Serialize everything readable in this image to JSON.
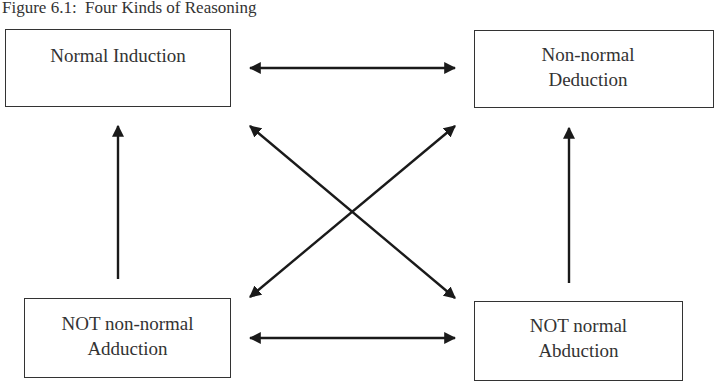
{
  "figure": {
    "title": "Figure 6.1:  Four Kinds of Reasoning"
  },
  "nodes": {
    "top_left": {
      "line1": "Normal Induction",
      "line2": ""
    },
    "top_right": {
      "line1": "Non-normal",
      "line2": "Deduction"
    },
    "bottom_left": {
      "line1": "NOT non-normal",
      "line2": "Adduction"
    },
    "bottom_right": {
      "line1": "NOT normal",
      "line2": "Abduction"
    }
  },
  "edges": [
    {
      "from": "top_left",
      "to": "top_right",
      "type": "bidirectional"
    },
    {
      "from": "bottom_left",
      "to": "bottom_right",
      "type": "bidirectional"
    },
    {
      "from": "top_left",
      "to": "bottom_right",
      "type": "bidirectional"
    },
    {
      "from": "top_right",
      "to": "bottom_left",
      "type": "bidirectional"
    },
    {
      "from": "bottom_left",
      "to": "top_left",
      "type": "unidirectional"
    },
    {
      "from": "bottom_right",
      "to": "top_right",
      "type": "unidirectional"
    }
  ],
  "colors": {
    "line": "#222222",
    "border": "#333333",
    "background": "#ffffff"
  }
}
